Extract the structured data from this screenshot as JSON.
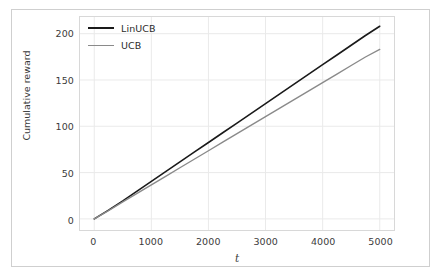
{
  "chart_data": {
    "type": "line",
    "title": "",
    "xlabel": "t",
    "ylabel": "Cumulative reward",
    "xlim": [
      -250,
      5250
    ],
    "ylim": [
      -12,
      218
    ],
    "xticks": [
      0,
      1000,
      2000,
      3000,
      4000,
      5000
    ],
    "yticks": [
      0,
      50,
      100,
      150,
      200
    ],
    "xtick_labels": [
      "0",
      "1000",
      "2000",
      "3000",
      "4000",
      "5000"
    ],
    "ytick_labels": [
      "0",
      "50",
      "100",
      "150",
      "200"
    ],
    "grid": true,
    "grid_color": "#eaeaea",
    "legend_position": "upper left",
    "legend_frame": false,
    "background": "#ffffff",
    "x": [
      0,
      250,
      500,
      750,
      1000,
      1250,
      1500,
      1750,
      2000,
      2250,
      2500,
      2750,
      3000,
      3250,
      3500,
      3750,
      4000,
      4250,
      4500,
      4750,
      5000
    ],
    "series": [
      {
        "name": "LinUCB",
        "color": "#1a1a1a",
        "linewidth": 1.6,
        "values": [
          0,
          9.5,
          19.5,
          30.0,
          40.5,
          51.0,
          61.5,
          72.0,
          82.5,
          93.0,
          103.5,
          114.0,
          124.5,
          135.0,
          145.5,
          156.0,
          166.5,
          177.0,
          187.5,
          198.0,
          208.0
        ]
      },
      {
        "name": "UCB",
        "color": "#8a8a8a",
        "linewidth": 1.4,
        "values": [
          0,
          9.0,
          18.3,
          27.6,
          36.8,
          46.0,
          55.2,
          64.4,
          73.6,
          82.8,
          92.0,
          101.2,
          110.4,
          119.6,
          128.8,
          138.0,
          147.2,
          156.4,
          165.6,
          174.8,
          183.0
        ]
      }
    ]
  },
  "legend": {
    "entries": [
      {
        "label": "LinUCB",
        "color": "#1a1a1a",
        "linewidth": 2.0
      },
      {
        "label": "UCB",
        "color": "#8a8a8a",
        "linewidth": 1.4
      }
    ]
  },
  "axes": {
    "xlabel": "t",
    "ylabel": "Cumulative reward"
  }
}
